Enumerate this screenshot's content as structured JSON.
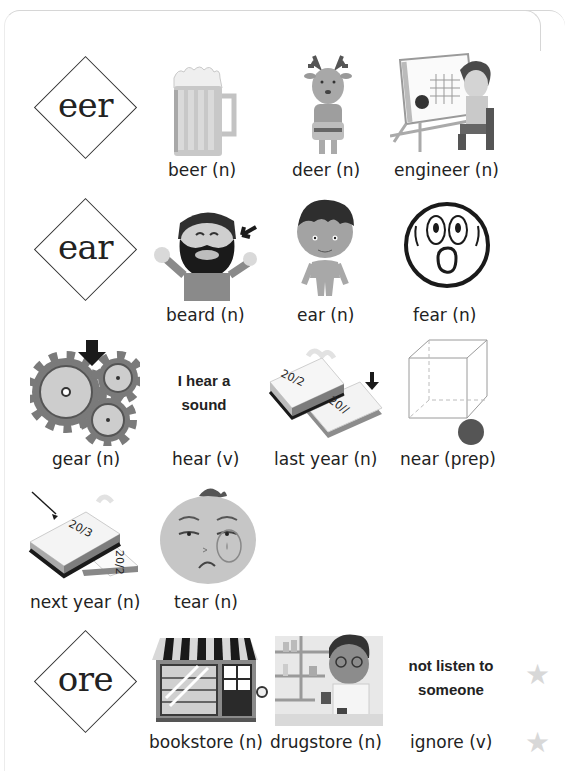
{
  "worksheet": {
    "sections": [
      {
        "pattern": "eer",
        "items": [
          {
            "word": "beer (n)",
            "picture": "beer-mug-icon"
          },
          {
            "word": "deer (n)",
            "picture": "deer-icon"
          },
          {
            "word": "engineer (n)",
            "picture": "engineer-icon"
          }
        ]
      },
      {
        "pattern": "ear",
        "items": [
          {
            "word": "beard (n)",
            "picture": "bearded-man-icon"
          },
          {
            "word": "ear (n)",
            "picture": "boy-ear-icon"
          },
          {
            "word": "fear (n)",
            "picture": "scared-face-icon"
          },
          {
            "word": "gear (n)",
            "picture": "gears-icon"
          },
          {
            "word": "hear (v)",
            "picture": "phrase",
            "phrase": [
              "I hear a",
              "sound"
            ]
          },
          {
            "word": "last year (n)",
            "picture": "calendar-2012-2011-icon",
            "cal_top": "20/2",
            "cal_bottom": "20//"
          },
          {
            "word": "near (prep)",
            "picture": "cube-ball-icon"
          },
          {
            "word": "next year (n)",
            "picture": "calendar-2013-2012-icon",
            "cal_top": "20/3",
            "cal_bottom": "20/2"
          },
          {
            "word": "tear (n)",
            "picture": "crying-face-icon"
          }
        ]
      },
      {
        "pattern": "ore",
        "items": [
          {
            "word": "bookstore (n)",
            "picture": "bookstore-icon"
          },
          {
            "word": "drugstore (n)",
            "picture": "pharmacist-icon"
          },
          {
            "word": "ignore (v)",
            "picture": "phrase",
            "phrase": [
              "not listen to",
              "someone"
            ]
          }
        ]
      }
    ]
  },
  "colors": {
    "text": "#222222",
    "light_gray": "#d0d0d0",
    "mid_gray": "#9a9a9a",
    "dark_gray": "#4a4a4a",
    "black": "#1a1a1a"
  }
}
